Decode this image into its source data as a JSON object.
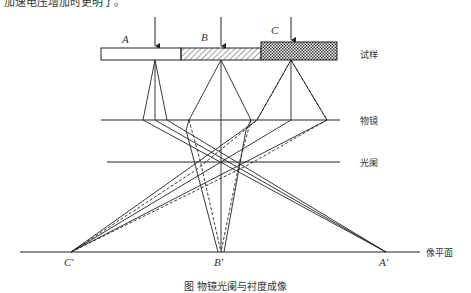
{
  "header": {
    "clipped_text": "加速电压增加时更明了。"
  },
  "labels": {
    "specimen": "试样",
    "objective_lens": "物镜",
    "aperture": "光阑",
    "image_plane": "像平面",
    "point_a": "A",
    "point_b": "B",
    "point_c": "C",
    "image_a": "A′",
    "image_b": "B′",
    "image_c": "C′"
  },
  "caption": "图  物镜光阑与衬度成像",
  "colors": {
    "line": "#222222",
    "specimen_a_fill": "#ffffff",
    "specimen_b_fill": "hatched",
    "specimen_c_fill": "crosshatched"
  },
  "geometry": {
    "specimen_y": [
      48,
      60
    ],
    "objective_y": 120,
    "aperture_y": 162,
    "image_plane_y": 252,
    "points_x": {
      "A": 155,
      "B": 221,
      "C": 291
    },
    "images_x": {
      "A": 386,
      "B": 221,
      "C": 71
    }
  }
}
